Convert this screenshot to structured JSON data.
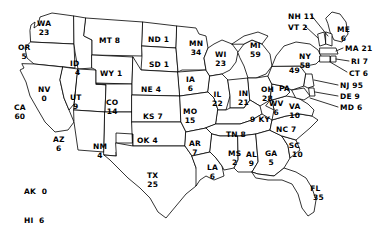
{
  "chart_data": {
    "type": "map",
    "title": "",
    "subtitle": "",
    "map_region": "United States",
    "value_label": "count",
    "legend_position": "bottom-left",
    "grid": false,
    "categories": [
      "WA",
      "OR",
      "ID",
      "MT",
      "ND",
      "SD",
      "MN",
      "WI",
      "MI",
      "WY",
      "NE",
      "IA",
      "IL",
      "IN",
      "OH",
      "NV",
      "UT",
      "CO",
      "KS",
      "MO",
      "KY",
      "WV",
      "VA",
      "CA",
      "AZ",
      "NM",
      "OK",
      "AR",
      "TN",
      "NC",
      "SC",
      "GA",
      "FL",
      "AL",
      "MS",
      "LA",
      "TX",
      "PA",
      "NY",
      "VT",
      "NH",
      "ME",
      "MA",
      "RI",
      "CT",
      "NJ",
      "DE",
      "MD",
      "AK",
      "HI",
      "Outside US"
    ],
    "values": [
      23,
      5,
      4,
      8,
      1,
      1,
      34,
      23,
      59,
      1,
      4,
      6,
      22,
      21,
      28,
      0,
      9,
      14,
      7,
      15,
      9,
      6,
      10,
      60,
      6,
      4,
      4,
      7,
      8,
      7,
      10,
      5,
      35,
      9,
      2,
      6,
      25,
      49,
      58,
      2,
      11,
      6,
      21,
      7,
      6,
      95,
      9,
      6,
      0,
      6,
      12
    ]
  },
  "map": {
    "states": [
      {
        "code": "WA",
        "value": "23",
        "layout": "stack",
        "x": 37,
        "y": 20
      },
      {
        "code": "OR",
        "value": "5",
        "layout": "stack",
        "x": 18,
        "y": 44
      },
      {
        "code": "ID",
        "value": "4",
        "layout": "stack-offset",
        "x": 69,
        "y": 60
      },
      {
        "code": "MT",
        "value": "8",
        "layout": "inline",
        "x": 99,
        "y": 37
      },
      {
        "code": "ND",
        "value": "1",
        "layout": "inline",
        "x": 148,
        "y": 36
      },
      {
        "code": "SD",
        "value": "1",
        "layout": "inline",
        "x": 149,
        "y": 61
      },
      {
        "code": "MN",
        "value": "34",
        "layout": "stack",
        "x": 189,
        "y": 40
      },
      {
        "code": "WI",
        "value": "23",
        "layout": "stack",
        "x": 215,
        "y": 51
      },
      {
        "code": "MI",
        "value": "59",
        "layout": "stack",
        "x": 250,
        "y": 42
      },
      {
        "code": "WY",
        "value": "1",
        "layout": "inline",
        "x": 100,
        "y": 70
      },
      {
        "code": "NE",
        "value": "4",
        "layout": "inline",
        "x": 141,
        "y": 86
      },
      {
        "code": "IA",
        "value": "6",
        "layout": "stack",
        "x": 186,
        "y": 76
      },
      {
        "code": "IL",
        "value": "22",
        "layout": "stack",
        "x": 212,
        "y": 91
      },
      {
        "code": "IN",
        "value": "21",
        "layout": "stack",
        "x": 238,
        "y": 90
      },
      {
        "code": "OH",
        "value": "28",
        "layout": "stack",
        "x": 261,
        "y": 86
      },
      {
        "code": "NV",
        "value": "0",
        "layout": "stack",
        "x": 38,
        "y": 86
      },
      {
        "code": "UT",
        "value": "9",
        "layout": "stack",
        "x": 70,
        "y": 94
      },
      {
        "code": "CO",
        "value": "14",
        "layout": "stack",
        "x": 106,
        "y": 99
      },
      {
        "code": "KS",
        "value": "7",
        "layout": "inline",
        "x": 143,
        "y": 113
      },
      {
        "code": "MO",
        "value": "15",
        "layout": "stack",
        "x": 183,
        "y": 108
      },
      {
        "code": "KY",
        "value": "9",
        "layout": "inline-rev",
        "x": 250,
        "y": 116
      },
      {
        "code": "WV",
        "value": "6",
        "layout": "stack",
        "x": 269,
        "y": 100
      },
      {
        "code": "VA",
        "value": "10",
        "layout": "stack",
        "x": 289,
        "y": 103
      },
      {
        "code": "CA",
        "value": "60",
        "layout": "stack",
        "x": 14,
        "y": 104
      },
      {
        "code": "AZ",
        "value": "6",
        "layout": "stack",
        "x": 53,
        "y": 136
      },
      {
        "code": "NM",
        "value": "4",
        "layout": "stack",
        "x": 93,
        "y": 143
      },
      {
        "code": "OK",
        "value": "4",
        "layout": "inline",
        "x": 137,
        "y": 137
      },
      {
        "code": "AR",
        "value": "7",
        "layout": "stack",
        "x": 189,
        "y": 140
      },
      {
        "code": "TN",
        "value": "8",
        "layout": "inline",
        "x": 226,
        "y": 131
      },
      {
        "code": "NC",
        "value": "7",
        "layout": "inline",
        "x": 276,
        "y": 126
      },
      {
        "code": "SC",
        "value": "10",
        "layout": "stack-offset",
        "x": 286,
        "y": 142
      },
      {
        "code": "GA",
        "value": "5",
        "layout": "stack",
        "x": 265,
        "y": 150
      },
      {
        "code": "FL",
        "value": "35",
        "layout": "stack-offset",
        "x": 307,
        "y": 185
      },
      {
        "code": "AL",
        "value": "9",
        "layout": "stack",
        "x": 246,
        "y": 151
      },
      {
        "code": "MS",
        "value": "2",
        "layout": "stack",
        "x": 228,
        "y": 150
      },
      {
        "code": "LA",
        "value": "6",
        "layout": "stack",
        "x": 207,
        "y": 164
      },
      {
        "code": "TX",
        "value": "25",
        "layout": "stack",
        "x": 147,
        "y": 172
      },
      {
        "code": "PA",
        "value": "49",
        "layout": "stack-wide",
        "x": 279,
        "y": 76
      },
      {
        "code": "NY",
        "value": "58",
        "layout": "stack",
        "x": 299,
        "y": 53
      }
    ],
    "callouts": [
      {
        "code": "NH",
        "value": "11",
        "x": 288,
        "y": 13,
        "anchor": "left"
      },
      {
        "code": "VT",
        "value": "2",
        "x": 288,
        "y": 24,
        "anchor": "left"
      },
      {
        "code": "ME",
        "value": "6",
        "x": 337,
        "y": 26,
        "anchor": "center"
      },
      {
        "code": "MA",
        "value": "21",
        "x": 345,
        "y": 45,
        "anchor": "left"
      },
      {
        "code": "RI",
        "value": "7",
        "x": 351,
        "y": 58,
        "anchor": "left"
      },
      {
        "code": "CT",
        "value": "6",
        "x": 349,
        "y": 70,
        "anchor": "left"
      },
      {
        "code": "NJ",
        "value": "95",
        "x": 340,
        "y": 82,
        "anchor": "left"
      },
      {
        "code": "DE",
        "value": "9",
        "x": 340,
        "y": 93,
        "anchor": "left"
      },
      {
        "code": "MD",
        "value": "6",
        "x": 340,
        "y": 104,
        "anchor": "left"
      }
    ],
    "legend": {
      "ak_line": "AK  0",
      "hi_line": "HI  6",
      "outside_line": "Outside US 12"
    }
  }
}
